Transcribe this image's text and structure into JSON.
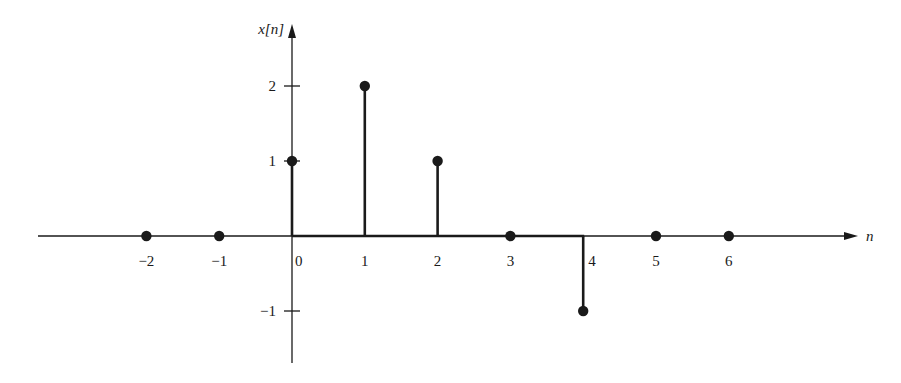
{
  "chart_data": {
    "type": "stem",
    "title": "",
    "xlabel": "n",
    "ylabel": "x[n]",
    "x": [
      -2,
      -1,
      0,
      1,
      2,
      3,
      4,
      5,
      6
    ],
    "values": [
      0,
      0,
      1,
      2,
      1,
      0,
      -1,
      0,
      0
    ],
    "x_tick_labels": [
      "−2",
      "−1",
      "0",
      "1",
      "2",
      "3",
      "4",
      "5",
      "6"
    ],
    "y_tick_labels": [
      "2",
      "1",
      "−1"
    ],
    "y_ticks": [
      2,
      1,
      -1
    ],
    "xlim": [
      -3.5,
      7.7
    ],
    "ylim": [
      -1.7,
      2.3
    ],
    "grid": false,
    "legend": null
  },
  "colors": {
    "ink": "#1a1a1a",
    "background": "#ffffff"
  }
}
